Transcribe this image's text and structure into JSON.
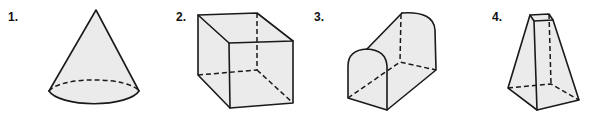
{
  "figures": [
    {
      "number": "1.",
      "shape": "cone"
    },
    {
      "number": "2.",
      "shape": "rectangular-prism"
    },
    {
      "number": "3.",
      "shape": "half-cylinder-on-rectangular-prism"
    },
    {
      "number": "4.",
      "shape": "square-frustum"
    }
  ],
  "colors": {
    "fill": "#ebebeb",
    "stroke": "#1a1a1a"
  }
}
